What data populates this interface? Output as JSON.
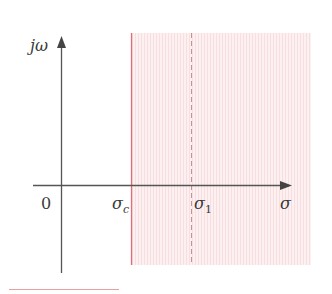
{
  "diagram": {
    "type": "s-plane region of convergence",
    "axes": {
      "vertical_label": "jω",
      "horizontal_label": "σ",
      "origin_label": "0"
    },
    "markers": [
      {
        "id": "sigma_c",
        "symbol": "σ",
        "subscript": "c",
        "line_style": "solid"
      },
      {
        "id": "sigma_1",
        "symbol": "σ",
        "subscript": "1",
        "line_style": "dashed"
      }
    ],
    "region": {
      "description": "shaded half-plane to the right of σc"
    },
    "colors": {
      "axis": "#555555",
      "boundary": "#d9707a",
      "dashed": "#c99a9a",
      "region_fill": "#fcecec",
      "region_stripe": "#f6dadd",
      "underline": "#e8a0a0"
    }
  }
}
